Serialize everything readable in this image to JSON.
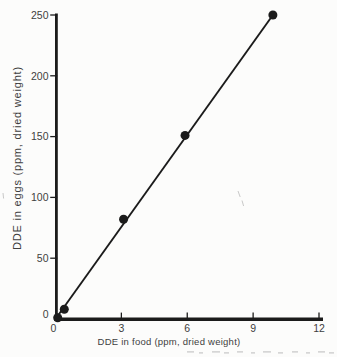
{
  "figure": {
    "background": "#fcfcfb",
    "ink_color": "#1b1b1b",
    "text_color": "#3e3e3e"
  },
  "chart_data": {
    "type": "scatter",
    "title": "",
    "xlabel": "DDE in food (ppm, dried weight)",
    "ylabel": "DDE in eggs (ppm, dried weight)",
    "xlim": [
      0,
      12
    ],
    "ylim": [
      0,
      250
    ],
    "x_ticks": [
      0,
      3,
      6,
      9,
      12
    ],
    "y_ticks": [
      0,
      50,
      100,
      150,
      200,
      250
    ],
    "grid": false,
    "legend": null,
    "series": [
      {
        "name": "observed",
        "marker": "filled-circle",
        "color": "#1b1b1b",
        "points": [
          [
            0.1,
            1
          ],
          [
            0.4,
            8
          ],
          [
            3.1,
            82
          ],
          [
            5.9,
            151
          ],
          [
            9.9,
            250
          ]
        ]
      }
    ],
    "fit_line": {
      "from": [
        0,
        0
      ],
      "to": [
        9.9,
        250
      ],
      "color": "#1b1b1b"
    }
  }
}
